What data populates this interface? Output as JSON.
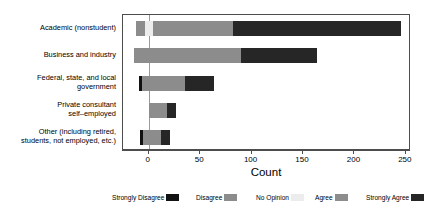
{
  "chart_data": {
    "type": "bar",
    "subtype": "diverging-stacked-likert",
    "title": "",
    "xlabel": "Count",
    "ylabel": "",
    "xlim": [
      -25,
      255
    ],
    "xticks": [
      0,
      50,
      100,
      150,
      200,
      250
    ],
    "xticklabels": [
      "0",
      "50",
      "100",
      "150",
      "200",
      "250"
    ],
    "grid": false,
    "legend_position": "bottom",
    "categories": [
      "Academic (nonstudent)",
      "Business and industry",
      "Federal, state, and local\ngovernment",
      "Private consultant\nself–employed",
      "Other (including retired,\nstudents, not employed, etc.)"
    ],
    "series": [
      {
        "name": "Strongly Disagree",
        "color": "#121212",
        "values": [
          0,
          0,
          2,
          0,
          2
        ]
      },
      {
        "name": "Disagree",
        "color": "#8c8c8c",
        "values": [
          8,
          14,
          7,
          0,
          0
        ]
      },
      {
        "name": "No Opinion",
        "color": "#ececec",
        "values": [
          8,
          0,
          0,
          0,
          0
        ]
      },
      {
        "name": "Agree",
        "color": "#8c8c8c",
        "values": [
          78,
          90,
          35,
          18,
          18
        ]
      },
      {
        "name": "Strongly Agree",
        "color": "#262626",
        "values": [
          163,
          74,
          28,
          9,
          9
        ]
      }
    ],
    "bar_start_offsets": [
      -12,
      -14,
      -9,
      0,
      -8
    ],
    "bar_totals_positive": [
      245,
      164,
      63,
      27,
      27
    ]
  },
  "axis": {
    "x_title": "Count",
    "tick_labels": [
      "0",
      "50",
      "100",
      "150",
      "200",
      "250"
    ]
  },
  "y_axis": {
    "labels": [
      "Academic (nonstudent)",
      "Business and industry",
      "Federal, state, and local\ngovernment",
      "Private consultant\nself–employed",
      "Other (including retired,\nstudents, not employed, etc.)"
    ]
  },
  "legend": {
    "items": [
      {
        "label": "Strongly Disagree",
        "color": "#121212"
      },
      {
        "label": "Disagree",
        "color": "#8c8c8c"
      },
      {
        "label": "No Opinion",
        "color": "#ececec"
      },
      {
        "label": "Agree",
        "color": "#8c8c8c"
      },
      {
        "label": "Strongly Agree",
        "color": "#262626"
      }
    ]
  },
  "colors": {
    "strongly_disagree": "#121212",
    "disagree": "#8c8c8c",
    "no_opinion": "#ececec",
    "agree": "#8c8c8c",
    "strongly_agree": "#262626",
    "frame": "#4d4d4d",
    "zero_line": "#9a9a9a",
    "background": "#ffffff"
  }
}
